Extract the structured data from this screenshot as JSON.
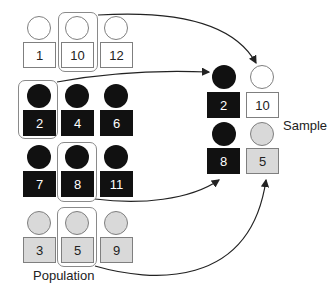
{
  "population": {
    "label": "Population",
    "rows": [
      {
        "color": "white",
        "items": [
          "1",
          "10",
          "12"
        ]
      },
      {
        "color": "black",
        "items": [
          "2",
          "4",
          "6"
        ]
      },
      {
        "color": "black",
        "items": [
          "7",
          "8",
          "11"
        ]
      },
      {
        "color": "gray",
        "items": [
          "3",
          "5",
          "9"
        ]
      }
    ],
    "selected": [
      "10",
      "2",
      "8",
      "5"
    ]
  },
  "sample": {
    "label": "Sample",
    "items": [
      {
        "value": "2",
        "color": "black"
      },
      {
        "value": "10",
        "color": "white"
      },
      {
        "value": "8",
        "color": "black"
      },
      {
        "value": "5",
        "color": "gray"
      }
    ]
  },
  "colors": {
    "black": "#111111",
    "white": "#ffffff",
    "gray": "#d9d9d9",
    "outline": "#7f7f7f"
  }
}
